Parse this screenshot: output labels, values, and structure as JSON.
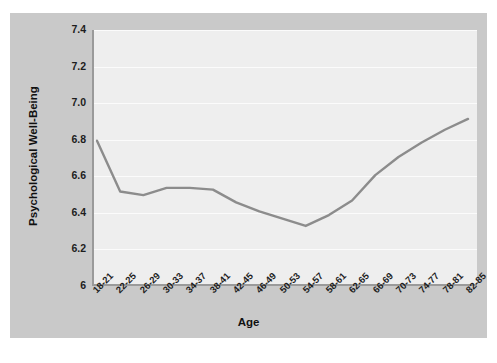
{
  "chart_data": {
    "type": "line",
    "title": "",
    "xlabel": "Age",
    "ylabel": "Psychological Well-Being",
    "ylim": [
      6,
      7.4
    ],
    "ytick_labels": [
      "7.4",
      "7.2",
      "7.0",
      "6.8",
      "6.6",
      "6.4",
      "6.2",
      "6"
    ],
    "yticks": [
      7.4,
      7.2,
      7.0,
      6.8,
      6.6,
      6.4,
      6.2,
      6.0
    ],
    "grid": true,
    "legend": "none",
    "categories": [
      "18-21",
      "22-25",
      "26-29",
      "30-33",
      "34-37",
      "38-41",
      "42-45",
      "46-49",
      "50-53",
      "54-57",
      "58-61",
      "62-65",
      "66-69",
      "70-73",
      "74-77",
      "78-81",
      "82-85"
    ],
    "values": [
      6.79,
      6.51,
      6.49,
      6.53,
      6.53,
      6.52,
      6.45,
      6.4,
      6.36,
      6.32,
      6.38,
      6.46,
      6.6,
      6.7,
      6.78,
      6.85,
      6.91
    ],
    "series": [
      {
        "name": "Psychological Well-Being",
        "color": "#8c8c8c",
        "values": [
          6.79,
          6.51,
          6.49,
          6.53,
          6.53,
          6.52,
          6.45,
          6.4,
          6.36,
          6.32,
          6.38,
          6.46,
          6.6,
          6.7,
          6.78,
          6.85,
          6.91
        ]
      }
    ]
  },
  "style": {
    "panel_bg": "#c9c9c9",
    "plot_bg": "#eeeeee",
    "grid_color": "#fbfbfb",
    "axis_color": "#9a9a9a",
    "line_color": "#8c8c8c",
    "text_color": "#1d1d1d"
  }
}
